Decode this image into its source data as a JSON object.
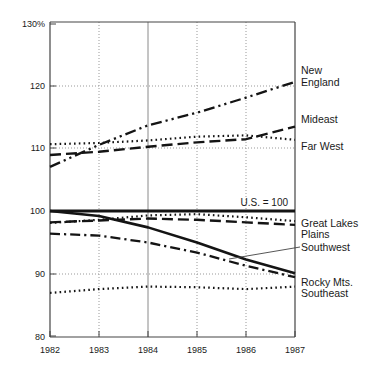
{
  "chart_data": {
    "type": "line",
    "title": "",
    "subtitle": "",
    "xlabel": "",
    "ylabel": "",
    "x": [
      1982,
      1983,
      1984,
      1985,
      1986,
      1987
    ],
    "xticklabels": [
      "1982",
      "1983",
      "1984",
      "1985",
      "1986",
      "1987"
    ],
    "xlim": [
      1982,
      1987
    ],
    "ylim": [
      80,
      130
    ],
    "yticks": [
      80,
      90,
      100,
      110,
      120,
      130
    ],
    "yticklabels": [
      "80",
      "90",
      "100",
      "110",
      "120",
      "130%"
    ],
    "grid": true,
    "grid_style": "dotted",
    "legend_position": "right-inline-labels",
    "reference_line": {
      "value": 100,
      "label": "U.S. = 100",
      "style": "thick-solid"
    },
    "series": [
      {
        "name": "New England",
        "style": "dash-dot-dot",
        "label": "New England",
        "label_lines": [
          "New",
          "England"
        ],
        "values": [
          107.0,
          110.5,
          113.6,
          115.6,
          118.0,
          120.5
        ]
      },
      {
        "name": "Far West",
        "style": "dotted",
        "label": "Far West",
        "label_lines": [
          "Far West"
        ],
        "values": [
          110.6,
          110.8,
          111.2,
          111.8,
          112.0,
          111.3
        ]
      },
      {
        "name": "Mideast",
        "style": "dashed",
        "label": "Mideast",
        "label_lines": [
          "Mideast"
        ],
        "values": [
          108.9,
          109.4,
          110.2,
          110.9,
          111.4,
          113.4
        ]
      },
      {
        "name": "Great Lakes",
        "style": "dotted",
        "label": "Great Lakes",
        "label_lines": [
          "Great Lakes"
        ],
        "values": [
          98.1,
          98.6,
          99.3,
          99.5,
          99.0,
          98.4
        ]
      },
      {
        "name": "Plains",
        "style": "dashed",
        "label": "Plains",
        "label_lines": [
          "Plains"
        ],
        "values": [
          98.2,
          98.5,
          98.8,
          98.6,
          98.2,
          97.8
        ]
      },
      {
        "name": "Southwest",
        "style": "dash-dot",
        "label": "Southwest",
        "label_lines": [
          "Southwest"
        ],
        "values": [
          96.4,
          96.1,
          95.0,
          93.4,
          91.3,
          89.5
        ]
      },
      {
        "name": "Rocky Mts.",
        "style": "thick-solid",
        "label": "Rocky Mts.",
        "label_lines": [
          "Rocky Mts."
        ],
        "values": [
          100.0,
          99.2,
          97.4,
          95.0,
          92.3,
          90.1
        ]
      },
      {
        "name": "Southeast",
        "style": "dotted",
        "label": "Southeast",
        "label_lines": [
          "Southeast"
        ],
        "values": [
          87.0,
          87.6,
          88.0,
          87.9,
          87.6,
          88.0
        ]
      }
    ],
    "right_labels": [
      {
        "id": "new-england",
        "lines": [
          "New",
          "England"
        ]
      },
      {
        "id": "mideast",
        "lines": [
          "Mideast"
        ]
      },
      {
        "id": "far-west",
        "lines": [
          "Far West"
        ]
      },
      {
        "id": "great-lakes-plains",
        "lines": [
          "Great Lakes",
          "Plains"
        ]
      },
      {
        "id": "southwest",
        "lines": [
          "Southwest"
        ]
      },
      {
        "id": "rocky-southeast",
        "lines": [
          "Rocky Mts.",
          "Southeast"
        ]
      }
    ],
    "colors": {
      "line": "#141414",
      "axis": "#333333",
      "grid": "#8c8c8c",
      "text": "#1a1a1a",
      "background": "#ffffff"
    }
  }
}
